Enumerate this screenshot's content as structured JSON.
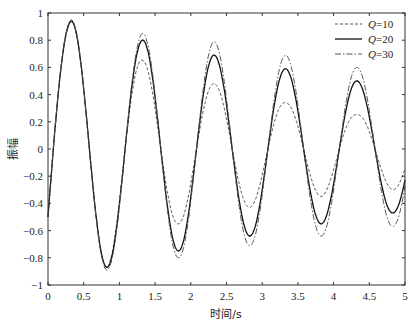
{
  "chart_data": {
    "type": "line",
    "title": "",
    "xlabel": "时间/s",
    "ylabel": "振幅",
    "xlim": [
      0,
      5
    ],
    "ylim": [
      -1,
      1
    ],
    "grid": false,
    "legend_position": "top-right",
    "x_ticks": [
      "0",
      "0.5",
      "1",
      "1.5",
      "2",
      "2.5",
      "3",
      "3.5",
      "4",
      "4.5",
      "5"
    ],
    "y_ticks": [
      "-1",
      "-0.8",
      "-0.6",
      "-0.4",
      "-0.2",
      "0",
      "0.2",
      "0.4",
      "0.6",
      "0.8",
      "1"
    ],
    "frequency_hz": 1.0,
    "start_value": -0.5,
    "series": [
      {
        "name": "Q=10",
        "style": "dashed",
        "peaks": [
          0.94,
          0.65,
          0.48,
          0.34,
          0.25
        ],
        "troughs": [
          -0.87,
          -0.55,
          -0.43,
          -0.35,
          -0.3
        ]
      },
      {
        "name": "Q=20",
        "style": "solid",
        "peaks": [
          0.94,
          0.8,
          0.69,
          0.59,
          0.5
        ],
        "troughs": [
          -0.87,
          -0.75,
          -0.64,
          -0.55,
          -0.47
        ]
      },
      {
        "name": "Q=30",
        "style": "dashdot",
        "peaks": [
          0.95,
          0.85,
          0.79,
          0.69,
          0.6
        ],
        "troughs": [
          -0.89,
          -0.8,
          -0.71,
          -0.64,
          -0.57
        ]
      }
    ]
  },
  "legend": {
    "items": [
      "Q=10",
      "Q=20",
      "Q=30"
    ]
  }
}
